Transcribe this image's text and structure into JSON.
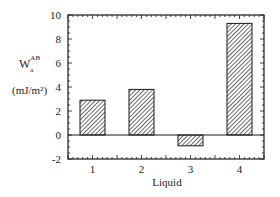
{
  "chart_data": {
    "type": "bar",
    "title": "",
    "xlabel": "Liquid",
    "ylabel_main": "W",
    "ylabel_sub": "a",
    "ylabel_sup": "AB",
    "ylabel_units": "(mJ/m²)",
    "categories": [
      "1",
      "2",
      "3",
      "4"
    ],
    "values": [
      2.9,
      3.8,
      -0.9,
      9.3
    ],
    "ylim": [
      -2,
      10
    ],
    "yticks": [
      -2,
      0,
      2,
      4,
      6,
      8,
      10
    ],
    "grid": false,
    "legend": null,
    "bar_fill": "hatched",
    "colors": {
      "axis": "#1a1a1a",
      "bar_edge": "#1a1a1a",
      "hatch": "#555555",
      "background": "#ffffff"
    }
  }
}
